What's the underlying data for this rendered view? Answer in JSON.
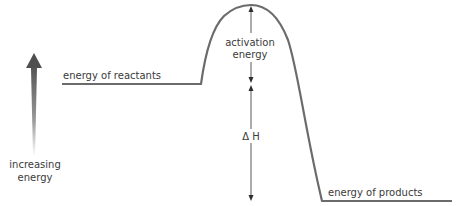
{
  "diagram": {
    "type": "energy-profile",
    "labels": {
      "reactants": "energy of reactants",
      "products": "energy of products",
      "activation_line1": "activation",
      "activation_line2": "energy",
      "delta_h": "Δ H",
      "axis_line1": "increasing",
      "axis_line2": "energy"
    },
    "colors": {
      "curve": "#6b6b6b",
      "arrow": "#2e2e2e",
      "axis_arrow_top": "#5a5a5a",
      "axis_arrow_bottom": "#ffffff",
      "text": "#3a3a3a"
    },
    "levels": {
      "reactants_y": 84,
      "peak_y": 5,
      "products_y": 201
    }
  }
}
